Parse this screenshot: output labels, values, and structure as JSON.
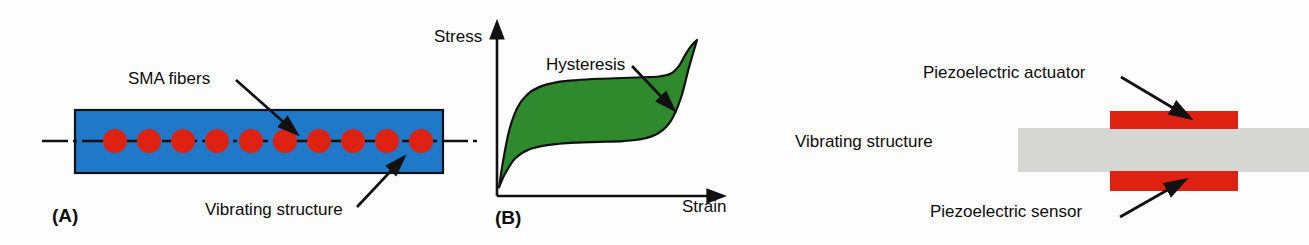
{
  "figure": {
    "background_color": "#fdfdfd",
    "width": 1309,
    "height": 245
  },
  "panel_a": {
    "tag": "(A)",
    "tag_x": 52,
    "tag_y": 206,
    "structure": {
      "fill_color": "#2079c8",
      "stroke_color": "#111111",
      "x": 75,
      "y": 110,
      "width": 368,
      "height": 63
    },
    "fibers": {
      "fill_color": "#dd2211",
      "count": 10,
      "radius": 12,
      "center_y": 141,
      "first_center_x": 115,
      "spacing": 34
    },
    "centerline": {
      "color": "#111111",
      "y": 141,
      "x_start": 42,
      "x_end": 477,
      "dash": "26,5,4,5"
    },
    "labels": [
      {
        "name": "sma-fibers",
        "text": "SMA fibers",
        "x": 128,
        "y": 70,
        "arrow_from_x": 236,
        "arrow_from_y": 80,
        "arrow_to_x": 297,
        "arrow_to_y": 134
      },
      {
        "name": "vibrating-structure",
        "text": "Vibrating structure",
        "x": 205,
        "y": 201,
        "arrow_from_x": 357,
        "arrow_from_y": 207,
        "arrow_to_x": 404,
        "arrow_to_y": 157
      }
    ]
  },
  "panel_b": {
    "tag": "(B)",
    "tag_x": 495,
    "tag_y": 208,
    "axis_color": "#111111",
    "y_axis_label": "Stress",
    "y_axis_label_x": 434,
    "y_axis_label_y": 28,
    "x_axis_label": "Strain",
    "x_axis_label_x": 682,
    "x_axis_label_y": 198,
    "annotation": {
      "text": "Hysteresis",
      "x": 546,
      "y": 56,
      "arrow_from_x": 632,
      "arrow_from_y": 66,
      "arrow_to_x": 674,
      "arrow_to_y": 110
    },
    "curve_fill_color": "#2f8a2e",
    "curve_stroke_color": "#111111",
    "origin_x": 497,
    "origin_y": 196,
    "y_axis_tip_y": 20,
    "x_axis_tip_x": 726,
    "chart_caption": "Stress-strain hysteresis loop of a shape memory alloy"
  },
  "panel_c": {
    "structure": {
      "label": "Vibrating structure",
      "label_x": 795,
      "label_y": 133,
      "fill_color": "#d6d7d2",
      "x": 1018,
      "y": 128,
      "width": 291,
      "height": 44
    },
    "actuator": {
      "label": "Piezoelectric actuator",
      "label_x": 923,
      "label_y": 64,
      "fill_color": "#dd2211",
      "x": 1110,
      "y": 111,
      "width": 128,
      "height": 18,
      "arrow_from_x": 1121,
      "arrow_from_y": 77,
      "arrow_to_x": 1190,
      "arrow_to_y": 118
    },
    "sensor": {
      "label": "Piezoelectric sensor",
      "label_x": 930,
      "label_y": 203,
      "fill_color": "#dd2211",
      "x": 1110,
      "y": 171,
      "width": 128,
      "height": 20,
      "arrow_from_x": 1120,
      "arrow_from_y": 217,
      "arrow_to_x": 1185,
      "arrow_to_y": 180
    }
  },
  "chart_data": {
    "type": "area",
    "title": "Hysteresis",
    "xlabel": "Strain",
    "ylabel": "Stress",
    "grid": false,
    "legend": null,
    "xlim": [
      0,
      1
    ],
    "ylim": [
      0,
      1
    ],
    "annotations": [
      "Hysteresis"
    ],
    "series": [
      {
        "name": "loading (upper branch)",
        "x": [
          0.0,
          0.02,
          0.05,
          0.09,
          0.14,
          0.2,
          0.28,
          0.38,
          0.5,
          0.62,
          0.72,
          0.8,
          0.86,
          0.9,
          0.93,
          0.96,
          0.99
        ],
        "values": [
          0.03,
          0.2,
          0.4,
          0.55,
          0.64,
          0.69,
          0.72,
          0.735,
          0.745,
          0.75,
          0.755,
          0.76,
          0.78,
          0.83,
          0.9,
          0.96,
          1.0
        ]
      },
      {
        "name": "unloading (lower branch)",
        "x": [
          0.0,
          0.03,
          0.08,
          0.15,
          0.25,
          0.38,
          0.5,
          0.62,
          0.72,
          0.8,
          0.86,
          0.91,
          0.95,
          0.99
        ],
        "values": [
          0.03,
          0.12,
          0.22,
          0.28,
          0.31,
          0.325,
          0.33,
          0.335,
          0.35,
          0.39,
          0.47,
          0.62,
          0.82,
          1.0
        ]
      }
    ],
    "fill_between": true,
    "fill_color": "#2f8a2e"
  }
}
